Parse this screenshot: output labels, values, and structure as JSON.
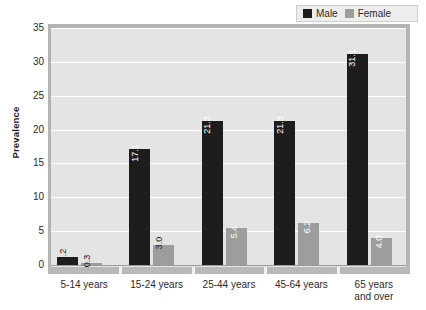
{
  "chart_data": {
    "type": "bar",
    "title": "",
    "subtitle": "",
    "xlabel": "",
    "ylabel": "Prevalence",
    "ylim": [
      0,
      35
    ],
    "yticks": [
      0,
      5,
      10,
      15,
      20,
      25,
      30,
      35
    ],
    "grid": true,
    "legend_position": "top-right",
    "categories": [
      "5-14 years",
      "15-24 years",
      "25-44 years",
      "45-64 years",
      "65 years and over"
    ],
    "category_lines": [
      [
        "5-14 years"
      ],
      [
        "15-24 years"
      ],
      [
        "25-44 years"
      ],
      [
        "45-64 years"
      ],
      [
        "65 years",
        "and over"
      ]
    ],
    "series": [
      {
        "name": "Male",
        "color": "#1d1d1d",
        "values": [
          1.2,
          17.1,
          21.3,
          21.3,
          31.1
        ],
        "labels": [
          "1.2",
          "17.1",
          "21.3",
          "21.3",
          "31.1"
        ]
      },
      {
        "name": "Female",
        "color": "#9d9d9d",
        "values": [
          0.3,
          3.0,
          5.4,
          6.2,
          4.0
        ],
        "labels": [
          "0.3",
          "3.0",
          "5.4",
          "6.2",
          "4.0"
        ]
      }
    ]
  },
  "legend": {
    "entries": [
      {
        "label": "Male",
        "color": "#1d1d1d"
      },
      {
        "label": "Female",
        "color": "#9d9d9d"
      }
    ]
  },
  "colors": {
    "plot_background": "#e4e4e4",
    "gridline": "#ffffff",
    "axis_border": "#b4b4b4",
    "axis_strip": "#b9b9b9",
    "male": "#1d1d1d",
    "female": "#9d9d9d",
    "page_background": "#ffffff"
  }
}
